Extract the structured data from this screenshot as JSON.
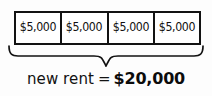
{
  "diagram": {
    "type": "tape-diagram",
    "title_text": "new rent = $20,000",
    "parts": [
      {
        "label": "$5,000",
        "value": 5000
      },
      {
        "label": "$5,000",
        "value": 5000
      },
      {
        "label": "$5,000",
        "value": 5000
      },
      {
        "label": "$5,000",
        "value": 5000
      }
    ],
    "brace": {
      "orientation": "down",
      "icon": "curly-brace-down-icon"
    },
    "caption": {
      "quantity_label": "new rent",
      "equals_sign": "=",
      "total_currency": "$",
      "total_amount": "20,000",
      "total_label": "$20,000"
    },
    "colors": {
      "ink": "#121212",
      "background": "#fdfdfd"
    }
  }
}
